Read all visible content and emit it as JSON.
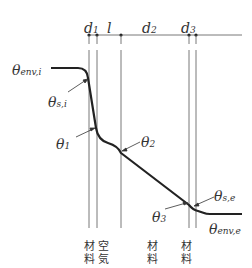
{
  "diagram": {
    "type": "temperature-profile-through-wall",
    "dimensions": {
      "d1": {
        "main": "d",
        "sub": "1"
      },
      "l": {
        "main": "l",
        "sub": ""
      },
      "d2": {
        "main": "d",
        "sub": "2"
      },
      "d3": {
        "main": "d",
        "sub": "3"
      }
    },
    "temperatures": {
      "theta_env_i": {
        "main": "θ",
        "sub": "env,i"
      },
      "theta_s_i": {
        "main": "θ",
        "sub": "s,i"
      },
      "theta_1": {
        "main": "θ",
        "sub": "1"
      },
      "theta_2": {
        "main": "θ",
        "sub": "2"
      },
      "theta_3": {
        "main": "θ",
        "sub": "3"
      },
      "theta_s_e": {
        "main": "θ",
        "sub": "s,e"
      },
      "theta_env_e": {
        "main": "θ",
        "sub": "env,e"
      }
    },
    "layers": [
      {
        "top": "材",
        "bottom": "料"
      },
      {
        "top": "空",
        "bottom": "気"
      },
      {
        "top": "材",
        "bottom": "料"
      },
      {
        "top": "材",
        "bottom": "料"
      }
    ],
    "colors": {
      "line": "#222222",
      "thin": "#555555",
      "text": "#333333"
    }
  }
}
